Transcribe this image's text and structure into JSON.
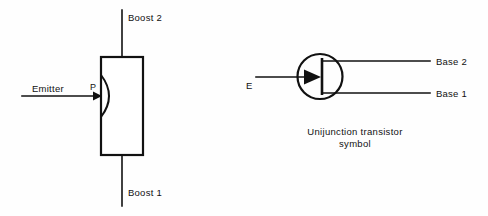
{
  "figure": {
    "background_color": "#fefefe",
    "ink_color": "#111111",
    "left_diagram": {
      "name": "unijunction-transistor-construction",
      "labels": {
        "top_terminal": "Boost 2",
        "bottom_terminal": "Boost 1",
        "side_terminal": "Emitter",
        "junction_marker": "P"
      }
    },
    "right_diagram": {
      "name": "unijunction-transistor-schematic-symbol",
      "labels": {
        "emitter_terminal": "E",
        "upper_base_terminal": "Base 2",
        "lower_base_terminal": "Base 1"
      },
      "caption_line_1": "Unijunction transistor",
      "caption_line_2": "symbol"
    }
  }
}
